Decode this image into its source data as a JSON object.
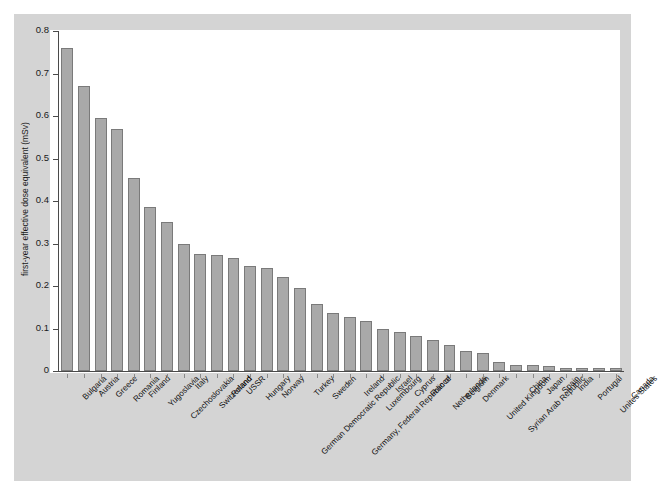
{
  "chart_data": {
    "type": "bar",
    "title": "",
    "xlabel": "",
    "ylabel": "first-year effective dose equivalent (mSv)",
    "ylim": [
      0,
      0.8
    ],
    "yticks": [
      "0",
      "0.1",
      "0.2",
      "0.3",
      "0.4",
      "0.5",
      "0.6",
      "0.7",
      "0.8"
    ],
    "ytick_values": [
      0,
      0.1,
      0.2,
      0.3,
      0.4,
      0.5,
      0.6,
      0.7,
      0.8
    ],
    "grid": false,
    "legend": "none",
    "orientation": "vertical",
    "bar_color": "#a9a9a9",
    "bar_edge_color": "#7a7a7a",
    "panel_color": "#d4d4d4",
    "plot_background": "#ffffff",
    "categories": [
      "Bulgaria",
      "Austria",
      "Greece",
      "Romania",
      "Finland",
      "Yugoslavia",
      "Czechoslovakia",
      "Italy",
      "Switzerland",
      "Poland",
      "USSR",
      "Hungary",
      "Norway",
      "German Democratic Republic",
      "Turkey",
      "Sweden",
      "Germany, Federal Republic of",
      "Ireland",
      "Luxembourg",
      "Israel",
      "Cyprus",
      "France",
      "Netherlands",
      "Belgium",
      "Denmark",
      "United Kingdom",
      "Syrian Arab Republic",
      "China",
      "Japan",
      "Spain",
      "India",
      "Portugal",
      "Unites States",
      "Canada"
    ],
    "values": [
      0.76,
      0.67,
      0.595,
      0.57,
      0.455,
      0.387,
      0.35,
      0.3,
      0.275,
      0.272,
      0.265,
      0.248,
      0.243,
      0.222,
      0.196,
      0.157,
      0.137,
      0.127,
      0.117,
      0.099,
      0.091,
      0.082,
      0.073,
      0.062,
      0.047,
      0.042,
      0.021,
      0.014,
      0.013,
      0.012,
      0.008,
      0.008,
      0.007,
      0.007
    ]
  }
}
